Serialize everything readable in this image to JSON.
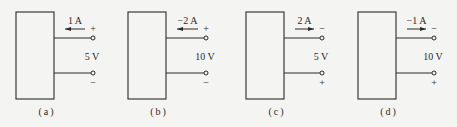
{
  "figure": {
    "panels": [
      {
        "id": "a",
        "label": "(a)",
        "current": "1 A",
        "current_direction": "left",
        "voltage": "5 V",
        "top_polarity": "+",
        "bottom_polarity": "−",
        "box_x": 16,
        "terminal_x": 93
      },
      {
        "id": "b",
        "label": "(b)",
        "current": "−2 A",
        "current_direction": "left",
        "voltage": "10 V",
        "top_polarity": "+",
        "bottom_polarity": "−",
        "box_x": 128,
        "terminal_x": 206
      },
      {
        "id": "c",
        "label": "(c)",
        "current": "2 A",
        "current_direction": "right",
        "voltage": "5 V",
        "top_polarity": "−",
        "bottom_polarity": "+",
        "box_x": 246,
        "terminal_x": 322
      },
      {
        "id": "d",
        "label": "(d)",
        "current": "−1 A",
        "current_direction": "right",
        "voltage": "10 V",
        "top_polarity": "−",
        "bottom_polarity": "+",
        "box_x": 358,
        "terminal_x": 434
      }
    ]
  },
  "colors": {
    "background": "#f4f4f2",
    "stroke": "#2a2a2a"
  }
}
